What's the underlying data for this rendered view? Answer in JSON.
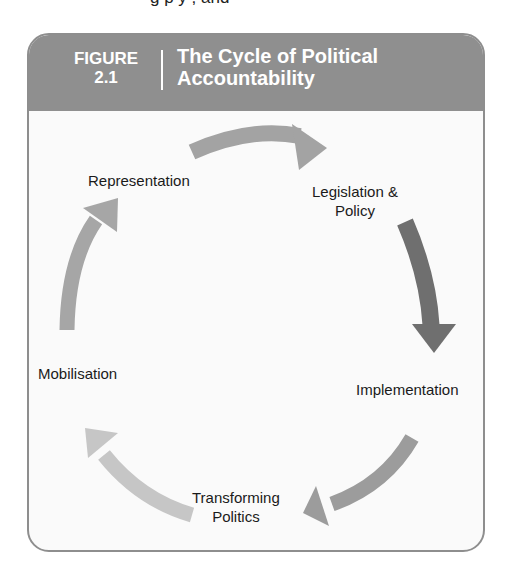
{
  "page": {
    "cutoff_text": "g                p                y      , and"
  },
  "figure": {
    "label_line1": "FIGURE",
    "label_line2": "2.1",
    "title_line1": "The Cycle of Political",
    "title_line2": "Accountability",
    "colors": {
      "header_bg": "#8f8f8f",
      "border": "#8e8e8e",
      "panel_bg": "#fafafa",
      "arrow_top": "#a3a3a3",
      "arrow_right": "#6f6f6f",
      "arrow_bottom_right": "#9c9c9c",
      "arrow_bottom_left": "#c6c6c6",
      "arrow_left": "#a6a6a6"
    },
    "nodes": [
      {
        "id": "representation",
        "lines": [
          "Representation"
        ]
      },
      {
        "id": "legislation-policy",
        "lines": [
          "Legislation &",
          "Policy"
        ]
      },
      {
        "id": "implementation",
        "lines": [
          "Implementation"
        ]
      },
      {
        "id": "transforming-politics",
        "lines": [
          "Transforming",
          "Politics"
        ]
      },
      {
        "id": "mobilisation",
        "lines": [
          "Mobilisation"
        ]
      }
    ],
    "cycle_order": [
      "Representation",
      "Legislation & Policy",
      "Implementation",
      "Transforming Politics",
      "Mobilisation"
    ]
  }
}
